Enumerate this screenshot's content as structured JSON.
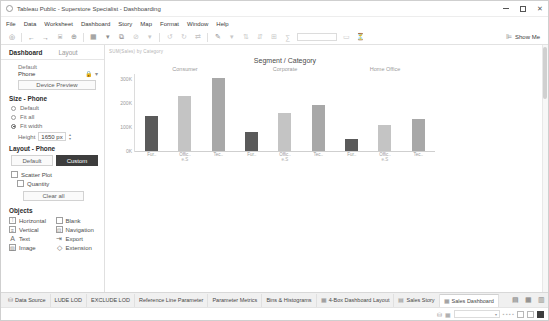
{
  "window": {
    "title": "Tableau Public - Superstore Specialist - Dashboarding",
    "logo_icon": "tableau-logo-icon",
    "minimize_label": "—",
    "maximize_label": "□",
    "close_label": "✕"
  },
  "menubar": {
    "items": [
      {
        "label": "File"
      },
      {
        "label": "Data"
      },
      {
        "label": "Worksheet"
      },
      {
        "label": "Dashboard"
      },
      {
        "label": "Story"
      },
      {
        "label": "Map"
      },
      {
        "label": "Format"
      },
      {
        "label": "Window"
      },
      {
        "label": "Help"
      }
    ]
  },
  "toolbar": {
    "buttons": [
      {
        "name": "tableau-home-icon",
        "glyph": "◎"
      },
      {
        "name": "back-arrow-icon",
        "glyph": "←"
      },
      {
        "name": "forward-arrow-icon",
        "glyph": "→"
      },
      {
        "name": "save-icon",
        "glyph": "⌸"
      },
      {
        "name": "add-data-source-icon",
        "glyph": "⊕"
      },
      {
        "name": "new-worksheet-icon",
        "glyph": "▦"
      },
      {
        "name": "new-worksheet-dropdown-icon",
        "glyph": "▾"
      },
      {
        "name": "duplicate-sheet-icon",
        "glyph": "⧉"
      },
      {
        "name": "clear-sheet-icon",
        "glyph": "⊘"
      },
      {
        "name": "clear-dropdown-icon",
        "glyph": "▾"
      },
      {
        "name": "undo-icon",
        "glyph": "↺"
      },
      {
        "name": "redo-icon",
        "glyph": "↻"
      },
      {
        "name": "swap-rows-columns-icon",
        "glyph": "⇄"
      },
      {
        "name": "highlight-icon",
        "glyph": "✎"
      },
      {
        "name": "highlight-dropdown-icon",
        "glyph": "▾"
      },
      {
        "name": "sort-ascending-icon",
        "glyph": "⇅"
      },
      {
        "name": "sort-descending-icon",
        "glyph": "⇵"
      },
      {
        "name": "group-members-icon",
        "glyph": "⊞"
      },
      {
        "name": "totals-icon",
        "glyph": "∑"
      }
    ],
    "fit_dropdown_value": "",
    "right_buttons": [
      {
        "name": "presentation-mode-icon",
        "glyph": "▭"
      },
      {
        "name": "filter-icon",
        "glyph": "⏳"
      }
    ],
    "show_me_label": "Show Me",
    "show_me_icon": "show-me-icon"
  },
  "left_pane": {
    "tabs": [
      {
        "label": "Dashboard",
        "active": true
      },
      {
        "label": "Layout",
        "active": false
      }
    ],
    "device_section": {
      "default_label": "Default",
      "device_value": "Phone",
      "lock_icon": "lock-icon",
      "dropdown_icon": "chevron-down-icon",
      "device_preview_label": "Device Preview"
    },
    "size_section": {
      "title": "Size - Phone",
      "options": [
        {
          "label": "Default",
          "selected": false
        },
        {
          "label": "Fit all",
          "selected": false
        },
        {
          "label": "Fit width",
          "selected": true
        }
      ],
      "height_label": "Height",
      "height_value": "1650 px"
    },
    "layout_section": {
      "title": "Layout - Phone",
      "toggle": [
        {
          "label": "Default",
          "active": false
        },
        {
          "label": "Custom",
          "active": true
        }
      ],
      "items": [
        {
          "label": "Scatter Plot",
          "icon": "sheet-icon"
        },
        {
          "label": "Quantity",
          "icon": "sheet-icon"
        }
      ],
      "clear_all_label": "Clear all"
    },
    "objects_section": {
      "title": "Objects",
      "items": [
        {
          "label": "Horizontal",
          "icon": "horizontal-container-icon",
          "glyph": "▥"
        },
        {
          "label": "Blank",
          "icon": "blank-object-icon",
          "glyph": ""
        },
        {
          "label": "Vertical",
          "icon": "vertical-container-icon",
          "glyph": "▤"
        },
        {
          "label": "Navigation",
          "icon": "navigation-object-icon",
          "glyph": "▣"
        },
        {
          "label": "Text",
          "icon": "text-object-icon",
          "glyph": "A"
        },
        {
          "label": "Export",
          "icon": "export-object-icon",
          "glyph": "⇨"
        },
        {
          "label": "Image",
          "icon": "image-object-icon",
          "glyph": "▨"
        },
        {
          "label": "Extension",
          "icon": "extension-object-icon",
          "glyph": "◇"
        }
      ]
    }
  },
  "canvas": {
    "sheet_meta": "SUM(Sales) by Category"
  },
  "chart_data": {
    "type": "bar",
    "title": "Segment / Category",
    "xlabel": "",
    "ylabel": "",
    "ylim": [
      0,
      320
    ],
    "yticks": [
      "300K",
      "200K",
      "100K",
      "0K"
    ],
    "ytick_values": [
      300,
      200,
      100,
      0
    ],
    "grid": false,
    "legend": "none",
    "groups": [
      "Consumer",
      "Corporate",
      "Home Office"
    ],
    "categories": [
      "Fur..",
      "Offic..",
      "Tec.."
    ],
    "category_sublabels": [
      "e.S",
      "e.S",
      "e.S"
    ],
    "bars": [
      {
        "group": "Consumer",
        "category": "Fur..",
        "value": 145,
        "color": "#5a5a5a"
      },
      {
        "group": "Consumer",
        "category": "Offic..",
        "value": 230,
        "color": "#c4c4c4"
      },
      {
        "group": "Consumer",
        "category": "Tec..",
        "value": 305,
        "color": "#a8a8a8"
      },
      {
        "group": "Corporate",
        "category": "Fur..",
        "value": 78,
        "color": "#5a5a5a"
      },
      {
        "group": "Corporate",
        "category": "Offic..",
        "value": 160,
        "color": "#c4c4c4"
      },
      {
        "group": "Corporate",
        "category": "Tec..",
        "value": 190,
        "color": "#a8a8a8"
      },
      {
        "group": "Home Office",
        "category": "Fur..",
        "value": 48,
        "color": "#5a5a5a"
      },
      {
        "group": "Home Office",
        "category": "Offic..",
        "value": 108,
        "color": "#c4c4c4"
      },
      {
        "group": "Home Office",
        "category": "Tec..",
        "value": 135,
        "color": "#a8a8a8"
      }
    ]
  },
  "worksheet_tabs": {
    "data_source": {
      "label": "Data Source",
      "icon": "data-source-icon",
      "glyph": "⛁"
    },
    "tabs": [
      {
        "label": "LUDE LOD",
        "icon": "sheet-icon",
        "glyph": "",
        "active": false
      },
      {
        "label": "EXCLUDE LOD",
        "icon": "sheet-icon",
        "glyph": "",
        "active": false
      },
      {
        "label": "Reference Line Parameter",
        "icon": "sheet-icon",
        "glyph": "",
        "active": false
      },
      {
        "label": "Parameter Metrics",
        "icon": "sheet-icon",
        "glyph": "",
        "active": false
      },
      {
        "label": "Bins & Histograms",
        "icon": "sheet-icon",
        "glyph": "",
        "active": false
      },
      {
        "label": "4-Box Dashboard Layout",
        "icon": "dashboard-icon",
        "glyph": "▦",
        "active": false
      },
      {
        "label": "Sales Story",
        "icon": "story-icon",
        "glyph": "▤",
        "active": false
      },
      {
        "label": "Sales Dashboard",
        "icon": "dashboard-icon",
        "glyph": "▦",
        "active": true
      }
    ],
    "actions": [
      {
        "name": "new-worksheet-tab-icon",
        "glyph": "▤"
      },
      {
        "name": "new-dashboard-tab-icon",
        "glyph": "▦"
      },
      {
        "name": "new-story-tab-icon",
        "glyph": "▥"
      }
    ]
  },
  "statusbar": {
    "left_icons": [
      {
        "name": "data-grid-icon",
        "glyph": "⛁"
      },
      {
        "name": "layout-icon",
        "glyph": "▦"
      }
    ],
    "combo_value": "",
    "combo_icon": "chevron-down-icon",
    "right_dots": "▪ ▪ ▪ ▪",
    "view_buttons": [
      {
        "name": "view-normal-icon",
        "filled": false
      },
      {
        "name": "view-fit-icon",
        "filled": false
      },
      {
        "name": "view-full-icon",
        "filled": true
      }
    ]
  }
}
